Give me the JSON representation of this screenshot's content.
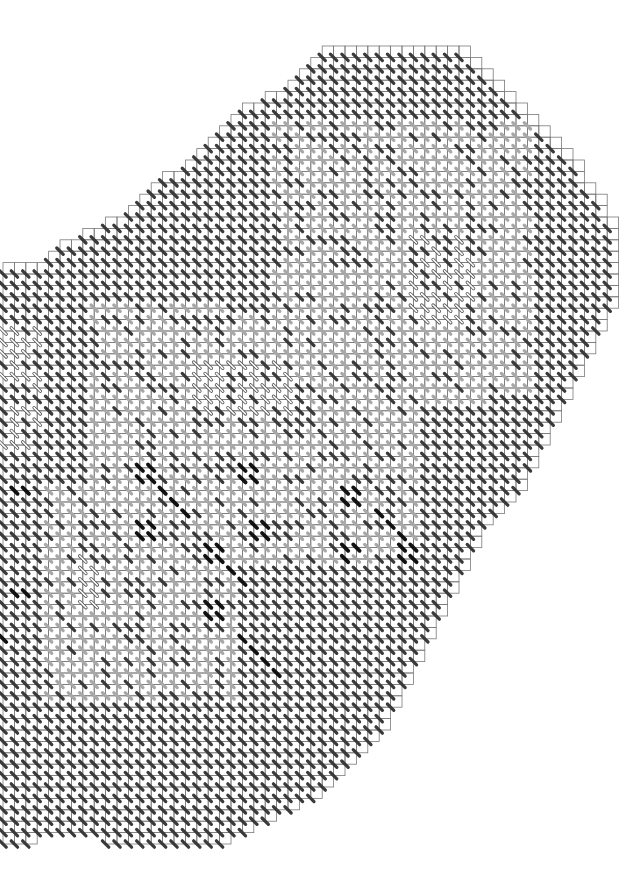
{
  "chart": {
    "type": "stitch-pattern-chart",
    "cell_size": 11.4,
    "origin_x": 3,
    "origin_y": 46,
    "cols": 56,
    "rows": 70,
    "colors": {
      "background": "#ffffff",
      "grid": "#7a7a7a",
      "stitch_black": "#111111",
      "stitch_dark": "#3a3a3a",
      "stitch_light": "#a8a8a8",
      "stitch_outline": "#555555"
    },
    "row_extents": [
      [
        28,
        40
      ],
      [
        27,
        41
      ],
      [
        26,
        42
      ],
      [
        25,
        43
      ],
      [
        23,
        44
      ],
      [
        21,
        45
      ],
      [
        20,
        46
      ],
      [
        19,
        47
      ],
      [
        18,
        48
      ],
      [
        17,
        49
      ],
      [
        16,
        50
      ],
      [
        14,
        50
      ],
      [
        13,
        51
      ],
      [
        12,
        52
      ],
      [
        11,
        52
      ],
      [
        9,
        53
      ],
      [
        7,
        53
      ],
      [
        5,
        53
      ],
      [
        4,
        53
      ],
      [
        0,
        53
      ],
      [
        0,
        53
      ],
      [
        0,
        53
      ],
      [
        0,
        53
      ],
      [
        0,
        52
      ],
      [
        0,
        52
      ],
      [
        0,
        51
      ],
      [
        0,
        51
      ],
      [
        0,
        50
      ],
      [
        0,
        50
      ],
      [
        0,
        49
      ],
      [
        0,
        49
      ],
      [
        0,
        48
      ],
      [
        0,
        48
      ],
      [
        0,
        47
      ],
      [
        0,
        47
      ],
      [
        0,
        46
      ],
      [
        0,
        46
      ],
      [
        0,
        45
      ],
      [
        0,
        45
      ],
      [
        0,
        44
      ],
      [
        0,
        43
      ],
      [
        0,
        42
      ],
      [
        0,
        41
      ],
      [
        0,
        41
      ],
      [
        0,
        40
      ],
      [
        0,
        40
      ],
      [
        0,
        39
      ],
      [
        0,
        39
      ],
      [
        0,
        38
      ],
      [
        0,
        38
      ],
      [
        0,
        37
      ],
      [
        0,
        37
      ],
      [
        0,
        36
      ],
      [
        0,
        36
      ],
      [
        0,
        35
      ],
      [
        0,
        35
      ],
      [
        0,
        34
      ],
      [
        0,
        34
      ],
      [
        0,
        33
      ],
      [
        0,
        33
      ],
      [
        0,
        32
      ],
      [
        0,
        31
      ],
      [
        0,
        30
      ],
      [
        0,
        29
      ],
      [
        0,
        28
      ],
      [
        0,
        27
      ],
      [
        0,
        25
      ],
      [
        0,
        23
      ],
      [
        0,
        21
      ],
      [
        0,
        19
      ]
    ],
    "bottom_gap": {
      "row": 69,
      "from_col": 3,
      "to_col": 8
    },
    "light_regions": [
      {
        "c0": 24,
        "c1": 46,
        "r0": 6,
        "r1": 30
      },
      {
        "c0": 8,
        "c1": 36,
        "r0": 22,
        "r1": 44
      },
      {
        "c0": 4,
        "c1": 20,
        "r0": 38,
        "r1": 56
      }
    ],
    "outline_regions": [
      {
        "c0": 0,
        "c1": 3,
        "r0": 24,
        "r1": 34
      },
      {
        "c0": 36,
        "c1": 41,
        "r0": 16,
        "r1": 23
      },
      {
        "c0": 17,
        "c1": 25,
        "r0": 27,
        "r1": 31
      },
      {
        "c0": 7,
        "c1": 8,
        "r0": 44,
        "r1": 48
      }
    ],
    "black_stitches": [
      [
        12,
        36
      ],
      [
        13,
        36
      ],
      [
        12,
        37
      ],
      [
        13,
        37
      ],
      [
        14,
        38
      ],
      [
        15,
        39
      ],
      [
        16,
        40
      ],
      [
        12,
        41
      ],
      [
        13,
        41
      ],
      [
        12,
        42
      ],
      [
        13,
        42
      ],
      [
        21,
        36
      ],
      [
        22,
        36
      ],
      [
        21,
        37
      ],
      [
        22,
        37
      ],
      [
        22,
        41
      ],
      [
        23,
        41
      ],
      [
        22,
        42
      ],
      [
        23,
        42
      ],
      [
        18,
        43
      ],
      [
        19,
        43
      ],
      [
        18,
        44
      ],
      [
        19,
        44
      ],
      [
        20,
        45
      ],
      [
        21,
        46
      ],
      [
        18,
        48
      ],
      [
        19,
        48
      ],
      [
        18,
        49
      ],
      [
        19,
        49
      ],
      [
        21,
        51
      ],
      [
        22,
        52
      ],
      [
        23,
        53
      ],
      [
        24,
        54
      ],
      [
        30,
        38
      ],
      [
        31,
        38
      ],
      [
        30,
        39
      ],
      [
        31,
        39
      ],
      [
        33,
        40
      ],
      [
        34,
        41
      ],
      [
        35,
        42
      ],
      [
        30,
        43
      ],
      [
        31,
        43
      ],
      [
        30,
        44
      ],
      [
        35,
        43
      ],
      [
        36,
        43
      ],
      [
        35,
        44
      ],
      [
        36,
        44
      ],
      [
        1,
        38
      ],
      [
        2,
        38
      ],
      [
        1,
        47
      ],
      [
        2,
        47
      ],
      [
        0,
        51
      ]
    ]
  }
}
